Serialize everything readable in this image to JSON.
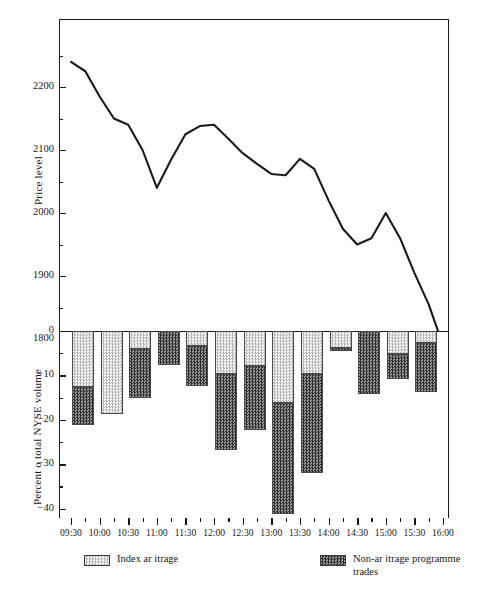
{
  "chart_data": [
    {
      "type": "line",
      "title": "",
      "xlabel": "",
      "ylabel": "Price level",
      "ylim": [
        1750,
        2280
      ],
      "yticks": [
        1800,
        1900,
        2000,
        2100,
        2200
      ],
      "ytick_labels": [
        "1800",
        "1900",
        "2000",
        "2100",
        "2200"
      ],
      "grid": false,
      "legend": "none",
      "x": [
        "09:30",
        "09:45",
        "10:00",
        "10:15",
        "10:30",
        "10:45",
        "11:00",
        "11:15",
        "11:30",
        "11:45",
        "12:00",
        "12:15",
        "12:30",
        "12:45",
        "13:00",
        "13:15",
        "13:30",
        "13:45",
        "14:00",
        "14:15",
        "14:30",
        "14:45",
        "15:00",
        "15:15",
        "15:30",
        "15:45",
        "16:00"
      ],
      "series": [
        {
          "name": "Price level",
          "values": [
            2240,
            2225,
            2185,
            2150,
            2140,
            2100,
            2040,
            2085,
            2125,
            2138,
            2140,
            2118,
            2095,
            2078,
            2062,
            2060,
            2086,
            2070,
            2020,
            1975,
            1950,
            1960,
            2000,
            1960,
            1905,
            1855,
            1790
          ]
        }
      ]
    },
    {
      "type": "bar",
      "stacked": true,
      "orientation": "vertical",
      "title": "",
      "xlabel": "",
      "ylabel": "Percent o  total NYSE volume",
      "ylim": [
        -44,
        0
      ],
      "yticks": [
        0,
        -10,
        -20,
        -30,
        -40
      ],
      "ytick_labels": [
        "0",
        "−10",
        "−20",
        "−30",
        "−40"
      ],
      "yminor_ticks": [
        -5,
        -15,
        -25,
        -35
      ],
      "grid": false,
      "categories": [
        "09:30",
        "10:00",
        "10:30",
        "11:00",
        "11:30",
        "12:00",
        "12:30",
        "13:00",
        "13:30",
        "14:00",
        "14:30",
        "15:00",
        "15:30"
      ],
      "series": [
        {
          "name": "Index ar itrage",
          "pattern": "light-checker",
          "values": [
            -12.7,
            -18.8,
            -4.0,
            0.0,
            -3.4,
            -9.7,
            -7.8,
            -16.3,
            -9.6,
            -3.9,
            0.0,
            -5.1,
            -2.6
          ]
        },
        {
          "name": "Non-ar itrage programme trades",
          "pattern": "dark-checker",
          "values": [
            -8.5,
            0.0,
            -11.0,
            -7.6,
            -9.0,
            -17.1,
            -14.4,
            -25.0,
            -22.4,
            -0.5,
            -14.1,
            -5.8,
            -11.1
          ]
        }
      ],
      "totals": [
        -21.2,
        -18.8,
        -15.0,
        -7.6,
        -12.4,
        -26.8,
        -22.2,
        -41.3,
        -32.0,
        -4.4,
        -14.1,
        -10.9,
        -13.7
      ]
    }
  ],
  "axes": {
    "price": {
      "ylabel": "Price level",
      "ytick_labels": [
        "2200",
        "2100",
        "2000",
        "1900",
        "1800"
      ]
    },
    "volume": {
      "ylabel": "Percent o  total NYSE volume",
      "ytick_labels": [
        "0",
        "−10",
        "−20",
        "−30",
        "−40"
      ]
    },
    "shared_x": {
      "tick_labels": [
        "09:30",
        "10:00",
        "10:30",
        "11:00",
        "11:30",
        "12:00",
        "12:30",
        "13:00",
        "13:30",
        "14:00",
        "14:30",
        "15:00",
        "15:30",
        "16:00"
      ]
    }
  },
  "legend": {
    "entries": [
      {
        "label": "Index ar  itrage",
        "swatch": "light-checker-swatch"
      },
      {
        "label": "Non-ar  itrage programme trades",
        "swatch": "dark-checker-swatch"
      }
    ]
  },
  "colors": {
    "axis": "#1a1a1a",
    "line": "#1a1a1a",
    "light_pattern_fg": "#b9b9b9",
    "light_pattern_bg": "#ffffff",
    "dark_pattern_fg": "#2e2e2e",
    "dark_pattern_bg": "#9a9a9a",
    "background": "#ffffff"
  }
}
